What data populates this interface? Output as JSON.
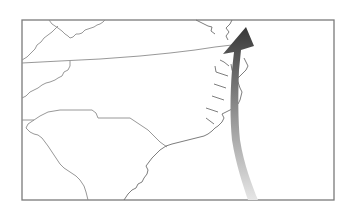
{
  "map": {
    "title": "",
    "region": "Southeastern United States (Virginia, North Carolina, South Carolina)",
    "colors": {
      "background": "#ffffff",
      "frame": "#7a7a7a",
      "borders": "#8c8c8c",
      "coast": "#6e6e6e",
      "track_start": "#e2e2e2",
      "track_end": "#3a3a3a"
    },
    "features": [
      {
        "name": "frame"
      },
      {
        "name": "virginia"
      },
      {
        "name": "north-carolina"
      },
      {
        "name": "south-carolina"
      },
      {
        "name": "georgia"
      },
      {
        "name": "tennessee"
      },
      {
        "name": "kentucky"
      },
      {
        "name": "chesapeake-bay"
      },
      {
        "name": "outer-banks"
      }
    ],
    "track": {
      "label": "storm-track-arrow",
      "direction": "north-northeast"
    }
  }
}
